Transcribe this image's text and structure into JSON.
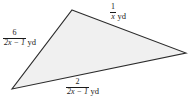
{
  "figure": {
    "name": "triangle-with-algebraic-side-labels",
    "shape": "triangle",
    "fill_color": "#f0f0f0",
    "stroke_color": "#2b2b2b",
    "background_color": "#ffffff",
    "vertices": [
      {
        "name": "top",
        "x": 72,
        "y": 10
      },
      {
        "name": "right",
        "x": 186,
        "y": 53
      },
      {
        "name": "bottom-left",
        "x": 12,
        "y": 89
      }
    ]
  },
  "labels": {
    "left": {
      "numerator": "6",
      "denominator": "2x − 1",
      "denominator_variable": "x",
      "unit": "yd",
      "full_text": "6/(2x − 1) yd"
    },
    "top_right": {
      "numerator": "1",
      "denominator": "x",
      "unit": "yd",
      "full_text": "1/x yd"
    },
    "bottom": {
      "numerator": "2",
      "denominator": "2x − 1",
      "denominator_variable": "x",
      "unit": "yd",
      "full_text": "2/(2x − 1) yd"
    }
  }
}
